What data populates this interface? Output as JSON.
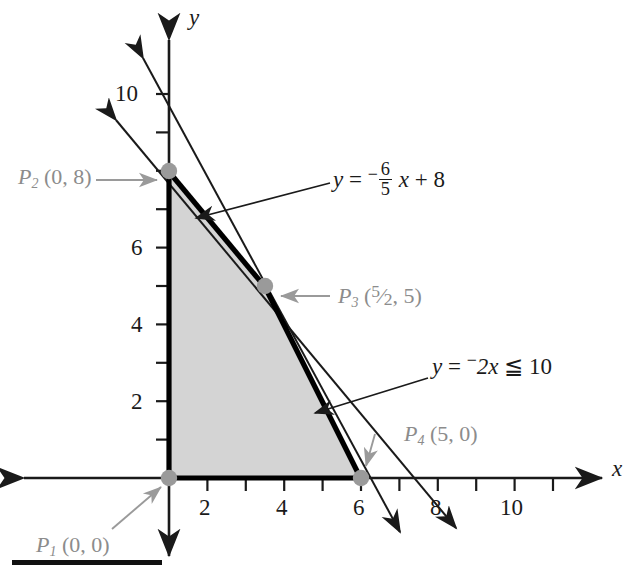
{
  "figure": {
    "type": "cartesian-graph"
  },
  "axes": {
    "x_label": "x",
    "y_label": "y",
    "x_ticks": [
      1,
      2,
      3,
      4,
      5,
      6,
      7,
      8,
      9,
      10,
      11
    ],
    "y_ticks": [
      1,
      2,
      3,
      4,
      5,
      6,
      7,
      8,
      9,
      10,
      11
    ],
    "x_tick_labels": [
      "2",
      "4",
      "6",
      "8",
      "10"
    ],
    "x_tick_label_values": [
      2,
      4,
      6,
      8,
      10
    ],
    "y_tick_labels": [
      "2",
      "4",
      "6",
      "10"
    ],
    "y_tick_label_values": [
      2,
      4,
      6,
      10
    ],
    "x_range": [
      -1.1,
      12.2
    ],
    "y_range": [
      -2.3,
      11.6
    ],
    "origin_px": [
      169,
      478
    ],
    "unit_px": 38.4
  },
  "region": {
    "name": "feasible-region",
    "fill_color": "#d4d4d4",
    "border_color": "#000000",
    "vertices": [
      [
        0,
        0
      ],
      [
        0,
        8
      ],
      [
        2.5,
        5
      ],
      [
        5,
        0
      ]
    ]
  },
  "lines": [
    {
      "id": "line-1",
      "equation_text": "y = ⁻6/5 x + 8",
      "slope": -1.2,
      "intercept": 8
    },
    {
      "id": "line-2",
      "equation_text": "y = ⁻2x ≦ 10",
      "slope": -2,
      "intercept": 10
    }
  ],
  "equation_labels": {
    "eq1": {
      "lhs": "y",
      "equals": "=",
      "neg": "−",
      "num": "6",
      "den": "5",
      "var": "x",
      "plus": "+",
      "const": "8"
    },
    "eq2": {
      "lhs": "y",
      "equals": "=",
      "neg": "−",
      "coef_var": "2x",
      "rel": "≦",
      "rhs": "10"
    }
  },
  "points": [
    {
      "id": "P1",
      "name": "P",
      "sub": "1",
      "coords": "(0, 0)",
      "x": 0,
      "y": 0
    },
    {
      "id": "P2",
      "name": "P",
      "sub": "2",
      "coords": "(0, 8)",
      "x": 0,
      "y": 8
    },
    {
      "id": "P3",
      "name": "P",
      "sub": "3",
      "coords_pre": "(",
      "num": "5",
      "den": "2",
      "coords_post": ", 5)",
      "x": 2.5,
      "y": 5
    },
    {
      "id": "P4",
      "name": "P",
      "sub": "4",
      "coords": "(5, 0)",
      "x": 5,
      "y": 0
    }
  ],
  "colors": {
    "point_marker": "#9a9a9a",
    "callout_text": "#8c8c8c",
    "callout_arrow": "#9a9a9a",
    "axis": "#1a1a1a",
    "region_fill": "#d4d4d4"
  }
}
